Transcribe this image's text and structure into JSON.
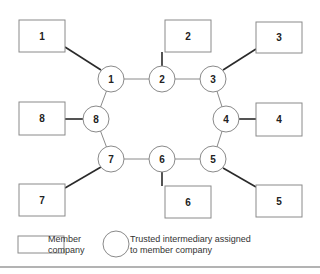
{
  "diagram": {
    "type": "ring-network",
    "member_companies": [
      {
        "id": "1",
        "label": "1",
        "x": 19,
        "y": 20,
        "w": 46,
        "h": 32
      },
      {
        "id": "2",
        "label": "2",
        "x": 165,
        "y": 20,
        "w": 46,
        "h": 32
      },
      {
        "id": "3",
        "label": "3",
        "x": 256,
        "y": 22,
        "w": 46,
        "h": 31
      },
      {
        "id": "4",
        "label": "4",
        "x": 256,
        "y": 103,
        "w": 46,
        "h": 33
      },
      {
        "id": "5",
        "label": "5",
        "x": 256,
        "y": 185,
        "w": 46,
        "h": 32
      },
      {
        "id": "6",
        "label": "6",
        "x": 165,
        "y": 186,
        "w": 46,
        "h": 32
      },
      {
        "id": "7",
        "label": "7",
        "x": 19,
        "y": 184,
        "w": 46,
        "h": 32
      },
      {
        "id": "8",
        "label": "8",
        "x": 19,
        "y": 102,
        "w": 46,
        "h": 33
      }
    ],
    "intermediaries": [
      {
        "id": "1",
        "label": "1",
        "cx": 111,
        "cy": 79,
        "r": 13
      },
      {
        "id": "2",
        "label": "2",
        "cx": 162,
        "cy": 79,
        "r": 13
      },
      {
        "id": "3",
        "label": "3",
        "cx": 213,
        "cy": 79,
        "r": 13
      },
      {
        "id": "4",
        "label": "4",
        "cx": 226,
        "cy": 119,
        "r": 13
      },
      {
        "id": "5",
        "label": "5",
        "cx": 213,
        "cy": 159,
        "r": 13
      },
      {
        "id": "6",
        "label": "6",
        "cx": 162,
        "cy": 159,
        "r": 13
      },
      {
        "id": "7",
        "label": "7",
        "cx": 111,
        "cy": 159,
        "r": 13
      },
      {
        "id": "8",
        "label": "8",
        "cx": 96,
        "cy": 119,
        "r": 13
      }
    ],
    "ring_edges": [
      [
        "1",
        "2"
      ],
      [
        "2",
        "3"
      ],
      [
        "3",
        "4"
      ],
      [
        "4",
        "5"
      ],
      [
        "5",
        "6"
      ],
      [
        "6",
        "7"
      ],
      [
        "7",
        "8"
      ],
      [
        "8",
        "1"
      ]
    ],
    "assignment_edges": [
      {
        "company": "1",
        "x1": 65,
        "y1": 47,
        "x2": 101,
        "y2": 70
      },
      {
        "company": "2",
        "x1": 162,
        "y1": 52,
        "x2": 162,
        "y2": 66
      },
      {
        "company": "3",
        "x1": 256,
        "y1": 49,
        "x2": 223,
        "y2": 70
      },
      {
        "company": "4",
        "x1": 239,
        "y1": 119,
        "x2": 256,
        "y2": 119
      },
      {
        "company": "5",
        "x1": 223,
        "y1": 168,
        "x2": 256,
        "y2": 187
      },
      {
        "company": "6",
        "x1": 162,
        "y1": 172,
        "x2": 162,
        "y2": 186
      },
      {
        "company": "7",
        "x1": 101,
        "y1": 167,
        "x2": 65,
        "y2": 188
      },
      {
        "company": "8",
        "x1": 65,
        "y1": 119,
        "x2": 83,
        "y2": 119
      }
    ]
  },
  "legend": {
    "box_label_line1": "Member",
    "box_label_line2": "company",
    "circle_label_line1": "Trusted intermediary assigned",
    "circle_label_line2": "to member company"
  },
  "colors": {
    "outline": "#8a8a8a",
    "link": "#2a2a2a",
    "text": "#222222"
  }
}
